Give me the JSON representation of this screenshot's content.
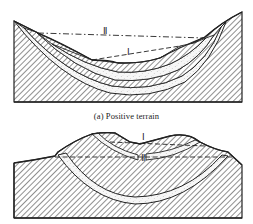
{
  "figure": {
    "panels": [
      {
        "id": "a",
        "caption": "(a) Positive terrain",
        "lines": [
          {
            "label": "Ⅱ",
            "style": "dash-dot",
            "description": "upper reference line"
          },
          {
            "label": "Ⅰ",
            "style": "dashed",
            "description": "lower reference line"
          }
        ]
      },
      {
        "id": "b",
        "caption": "",
        "lines": [
          {
            "label": "Ⅰ",
            "style": "dashed",
            "description": "upper reference line"
          },
          {
            "label": "Ⅱ",
            "style": "dashed",
            "description": "lower reference line"
          }
        ]
      }
    ],
    "colors": {
      "ink": "#222222",
      "background": "#ffffff",
      "sand": "#f4f4f4"
    }
  }
}
